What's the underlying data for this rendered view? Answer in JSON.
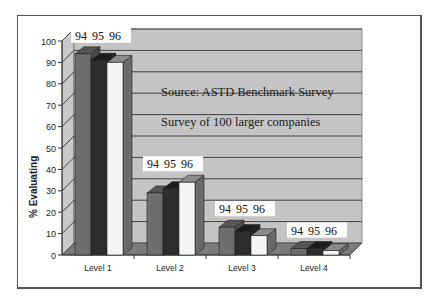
{
  "chart_data": {
    "type": "bar",
    "style": "3d-clustered",
    "title": "",
    "annotations": [
      "Source: ASTD Benchmark Survey",
      "Survey of 100 larger companies"
    ],
    "xlabel": "",
    "ylabel": "% Evaluating",
    "ylim": [
      0,
      100
    ],
    "yticks": [
      0,
      10,
      20,
      30,
      40,
      50,
      60,
      70,
      80,
      90,
      100
    ],
    "grid": true,
    "legend": "none",
    "categories": [
      "Level 1",
      "Level 2",
      "Level 3",
      "Level 4"
    ],
    "series": [
      {
        "name": "94",
        "color": "#6e6e6e",
        "values": [
          94,
          29,
          13,
          3
        ]
      },
      {
        "name": "95",
        "color": "#2e2e2e",
        "values": [
          91,
          31,
          11,
          3
        ]
      },
      {
        "name": "96",
        "color": "#f2f2f2",
        "values": [
          90,
          34,
          9,
          2
        ]
      }
    ],
    "group_labels": [
      "94",
      "95",
      "96"
    ]
  },
  "ylabel": "% Evaluating",
  "source_note": "Source: ASTD Benchmark Survey",
  "survey_note": "Survey of 100 larger companies",
  "categories": [
    "Level 1",
    "Level 2",
    "Level 3",
    "Level 4"
  ],
  "year_labels": [
    "94",
    "95",
    "96"
  ]
}
